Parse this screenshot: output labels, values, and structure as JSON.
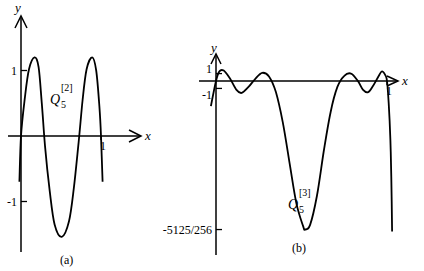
{
  "chart_data": [
    {
      "id": "a",
      "type": "line",
      "caption": "(a)",
      "xlabel": "x",
      "ylabel": "y",
      "curve_label": {
        "base": "Q",
        "sub": "5",
        "sup": "[2]"
      },
      "x_ticks": [
        {
          "value": 1,
          "label": "1"
        }
      ],
      "y_ticks": [
        {
          "value": 1,
          "label": "1"
        },
        {
          "value": -1,
          "label": "-1"
        }
      ],
      "xlim": [
        -0.16,
        1.5
      ],
      "ylim": [
        -1.6,
        1.8
      ],
      "series": [
        {
          "name": "Q5[2]",
          "points": [
            [
              -0.02,
              -0.7
            ],
            [
              0.0,
              0.0
            ],
            [
              0.05,
              0.6
            ],
            [
              0.1,
              1.02
            ],
            [
              0.17,
              1.2
            ],
            [
              0.22,
              1.05
            ],
            [
              0.26,
              0.5
            ],
            [
              0.3,
              -0.15
            ],
            [
              0.36,
              -0.85
            ],
            [
              0.42,
              -1.35
            ],
            [
              0.51,
              -1.54
            ],
            [
              0.6,
              -1.3
            ],
            [
              0.66,
              -0.8
            ],
            [
              0.72,
              -0.1
            ],
            [
              0.77,
              0.55
            ],
            [
              0.82,
              1.02
            ],
            [
              0.89,
              1.2
            ],
            [
              0.94,
              1.0
            ],
            [
              0.98,
              0.45
            ],
            [
              1.0,
              0.0
            ],
            [
              1.02,
              -0.7
            ]
          ]
        }
      ]
    },
    {
      "id": "b",
      "type": "line",
      "caption": "(b)",
      "xlabel": "x",
      "ylabel": "y",
      "curve_label": {
        "base": "Q",
        "sub": "5",
        "sup": "[3]"
      },
      "x_ticks": [
        {
          "value": 1,
          "label": "1"
        }
      ],
      "y_ticks": [
        {
          "value": 1,
          "label": "1"
        },
        {
          "value": -1,
          "label": "-1"
        },
        {
          "value": -20.02,
          "label": "-5125/256"
        }
      ],
      "xlim": [
        -0.05,
        1.1
      ],
      "ylim": [
        -20.5,
        4.5
      ],
      "series": [
        {
          "name": "Q5[3]",
          "points": [
            [
              -0.03,
              -3.4
            ],
            [
              0.0,
              0.0
            ],
            [
              0.02,
              1.3
            ],
            [
              0.045,
              1.4
            ],
            [
              0.08,
              0.4
            ],
            [
              0.12,
              -1.2
            ],
            [
              0.15,
              -1.6
            ],
            [
              0.19,
              -0.8
            ],
            [
              0.23,
              0.3
            ],
            [
              0.27,
              1.1
            ],
            [
              0.31,
              0.6
            ],
            [
              0.35,
              -1.5
            ],
            [
              0.39,
              -5.5
            ],
            [
              0.43,
              -11
            ],
            [
              0.47,
              -16.5
            ],
            [
              0.51,
              -19.6
            ],
            [
              0.52,
              -20.02
            ],
            [
              0.55,
              -19.4
            ],
            [
              0.59,
              -15.5
            ],
            [
              0.63,
              -9.5
            ],
            [
              0.67,
              -4.2
            ],
            [
              0.71,
              -0.8
            ],
            [
              0.75,
              0.7
            ],
            [
              0.79,
              1.0
            ],
            [
              0.83,
              0.0
            ],
            [
              0.86,
              -1.2
            ],
            [
              0.89,
              -1.5
            ],
            [
              0.92,
              -0.6
            ],
            [
              0.95,
              0.6
            ],
            [
              0.97,
              1.3
            ],
            [
              0.99,
              0.8
            ],
            [
              1.0,
              0.0
            ],
            [
              1.01,
              -3
            ],
            [
              1.02,
              -8
            ],
            [
              1.025,
              -13
            ],
            [
              1.03,
              -20.3
            ]
          ]
        }
      ]
    }
  ]
}
